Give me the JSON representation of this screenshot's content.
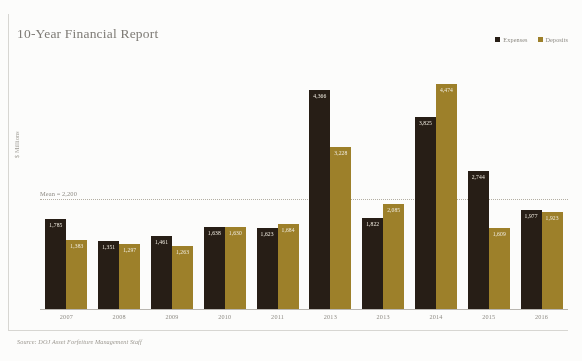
{
  "chart_data": {
    "type": "bar",
    "title": "10-Year Financial Report",
    "xlabel": "",
    "ylabel": "$ Millions",
    "ylim": [
      0,
      5000
    ],
    "grid": false,
    "legend_position": "top-right",
    "categories": [
      "2007",
      "2008",
      "2009",
      "2010",
      "2011",
      "2013",
      "2013",
      "2014",
      "2015",
      "2016"
    ],
    "series": [
      {
        "name": "Expenses",
        "color": "#241b13",
        "values": [
          1785,
          1351,
          1461,
          1638,
          1623,
          4366,
          1822,
          3825,
          2744,
          1977
        ],
        "value_labels": [
          "1,785",
          "1,351",
          "1,461",
          "1,638",
          "1,623",
          "4,366",
          "1,822",
          "3,825",
          "2,744",
          "1,977"
        ]
      },
      {
        "name": "Deposits",
        "color": "#9c7f27",
        "values": [
          1383,
          1297,
          1263,
          1630,
          1684,
          3228,
          2085,
          4474,
          1609,
          1923
        ],
        "value_labels": [
          "1,383",
          "1,297",
          "1,263",
          "1,630",
          "1,684",
          "3,228",
          "2,085",
          "4,474",
          "1,609",
          "1,923"
        ]
      }
    ],
    "annotations": [
      {
        "name": "mean-line",
        "text": "Mean = 2,200",
        "value": 2200
      }
    ],
    "source": "Source: DOJ Asset Forfeiture Management Staff"
  },
  "legend": {
    "items": [
      {
        "label": "Expenses",
        "color": "#241b13"
      },
      {
        "label": "Deposits",
        "color": "#9c7f27"
      }
    ]
  }
}
